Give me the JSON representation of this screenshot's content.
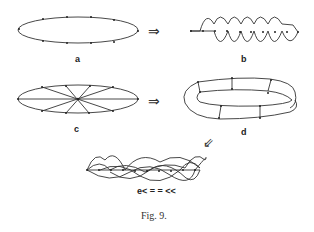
{
  "figure": {
    "caption": "Fig. 9.",
    "panels": [
      {
        "id": "a",
        "label": "a",
        "description": "ellipse loop with marked points"
      },
      {
        "id": "b",
        "label": "b",
        "description": "zigzag wave with points on a line"
      },
      {
        "id": "c",
        "label": "c",
        "description": "ellipse with radial chords through center"
      },
      {
        "id": "d",
        "label": "d",
        "description": "twisted band / Mobius-like ring with rungs"
      },
      {
        "id": "e",
        "label": "e< = = <<",
        "description": "braided strands with points"
      }
    ],
    "arrows": [
      {
        "from": "a",
        "to": "b",
        "symbol": "⇒"
      },
      {
        "from": "c",
        "to": "d",
        "symbol": "⇒"
      },
      {
        "from": "d",
        "to": "e",
        "symbol": "⇙"
      }
    ]
  },
  "colors": {
    "ink": "#222222",
    "background": "#ffffff"
  }
}
